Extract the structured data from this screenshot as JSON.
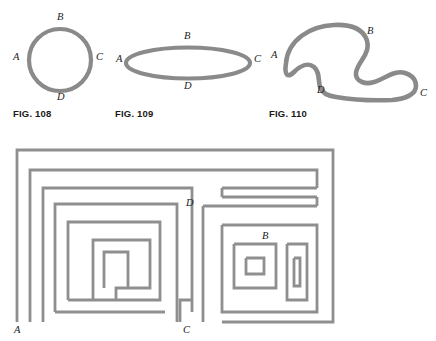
{
  "page": {
    "width": 436,
    "height": 341,
    "background": "#ffffff",
    "stroke_color": "#8a8a8a",
    "stroke_color_thin": "#9a9a9a",
    "text_color": "#2b2b2b"
  },
  "figures": [
    {
      "id": "fig-108",
      "caption": "FIG. 108",
      "shape": "circle",
      "caption_pos": {
        "x": 13,
        "y": 108
      },
      "points": [
        {
          "label": "B",
          "x": 57,
          "y": 17
        },
        {
          "label": "C",
          "x": 96,
          "y": 57
        },
        {
          "label": "D",
          "x": 57,
          "y": 97
        },
        {
          "label": "A",
          "x": 15,
          "y": 57
        }
      ]
    },
    {
      "id": "fig-109",
      "caption": "FIG. 109",
      "shape": "ellipse",
      "caption_pos": {
        "x": 115,
        "y": 108
      },
      "points": [
        {
          "label": "B",
          "x": 184,
          "y": 34
        },
        {
          "label": "C",
          "x": 254,
          "y": 58
        },
        {
          "label": "D",
          "x": 184,
          "y": 84
        },
        {
          "label": "A",
          "x": 116,
          "y": 58
        }
      ]
    },
    {
      "id": "fig-110",
      "caption": "FIG. 110",
      "shape": "blob",
      "caption_pos": {
        "x": 269,
        "y": 108
      },
      "points": [
        {
          "label": "B",
          "x": 367,
          "y": 29
        },
        {
          "label": "C",
          "x": 420,
          "y": 93
        },
        {
          "label": "D",
          "x": 319,
          "y": 90
        },
        {
          "label": "A",
          "x": 271,
          "y": 55
        }
      ]
    },
    {
      "id": "fig-maze",
      "caption": "",
      "shape": "maze-closed-curve",
      "points": [
        {
          "label": "A",
          "x": 14,
          "y": 326
        },
        {
          "label": "B",
          "x": 264,
          "y": 236
        },
        {
          "label": "C",
          "x": 185,
          "y": 326
        },
        {
          "label": "D",
          "x": 186,
          "y": 203
        }
      ]
    }
  ]
}
